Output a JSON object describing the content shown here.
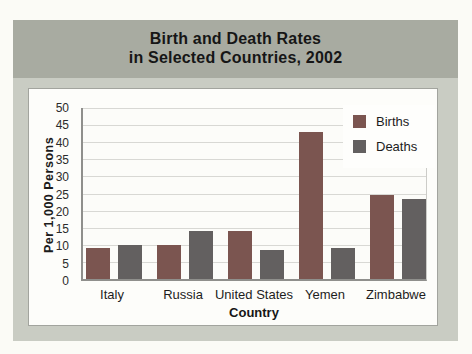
{
  "title": {
    "line1": "Birth and Death Rates",
    "line2": "in Selected Countries, 2002"
  },
  "colors": {
    "page_bg": "#fbfbf6",
    "card_bg": "#c9ccc3",
    "banner_bg": "#a8aba1",
    "births_bar": "#7b5550",
    "deaths_bar": "#636060"
  },
  "chart_data": {
    "type": "bar",
    "title": "Birth and Death Rates in Selected Countries, 2002",
    "categories": [
      "Italy",
      "Russia",
      "United States",
      "Yemen",
      "Zimbabwe"
    ],
    "series": [
      {
        "name": "Births",
        "color": "#7b5550",
        "values": [
          9,
          10,
          14,
          43,
          24.5
        ]
      },
      {
        "name": "Deaths",
        "color": "#636060",
        "values": [
          10,
          14,
          8.5,
          9,
          23.5
        ]
      }
    ],
    "xlabel": "Country",
    "ylabel": "Per  1,000  Persons",
    "ylim": [
      0,
      50
    ],
    "ytick_step": 5,
    "yticks": [
      50,
      45,
      40,
      35,
      30,
      25,
      20,
      15,
      10,
      5,
      0
    ],
    "grid": true,
    "legend_position": "top-right"
  }
}
